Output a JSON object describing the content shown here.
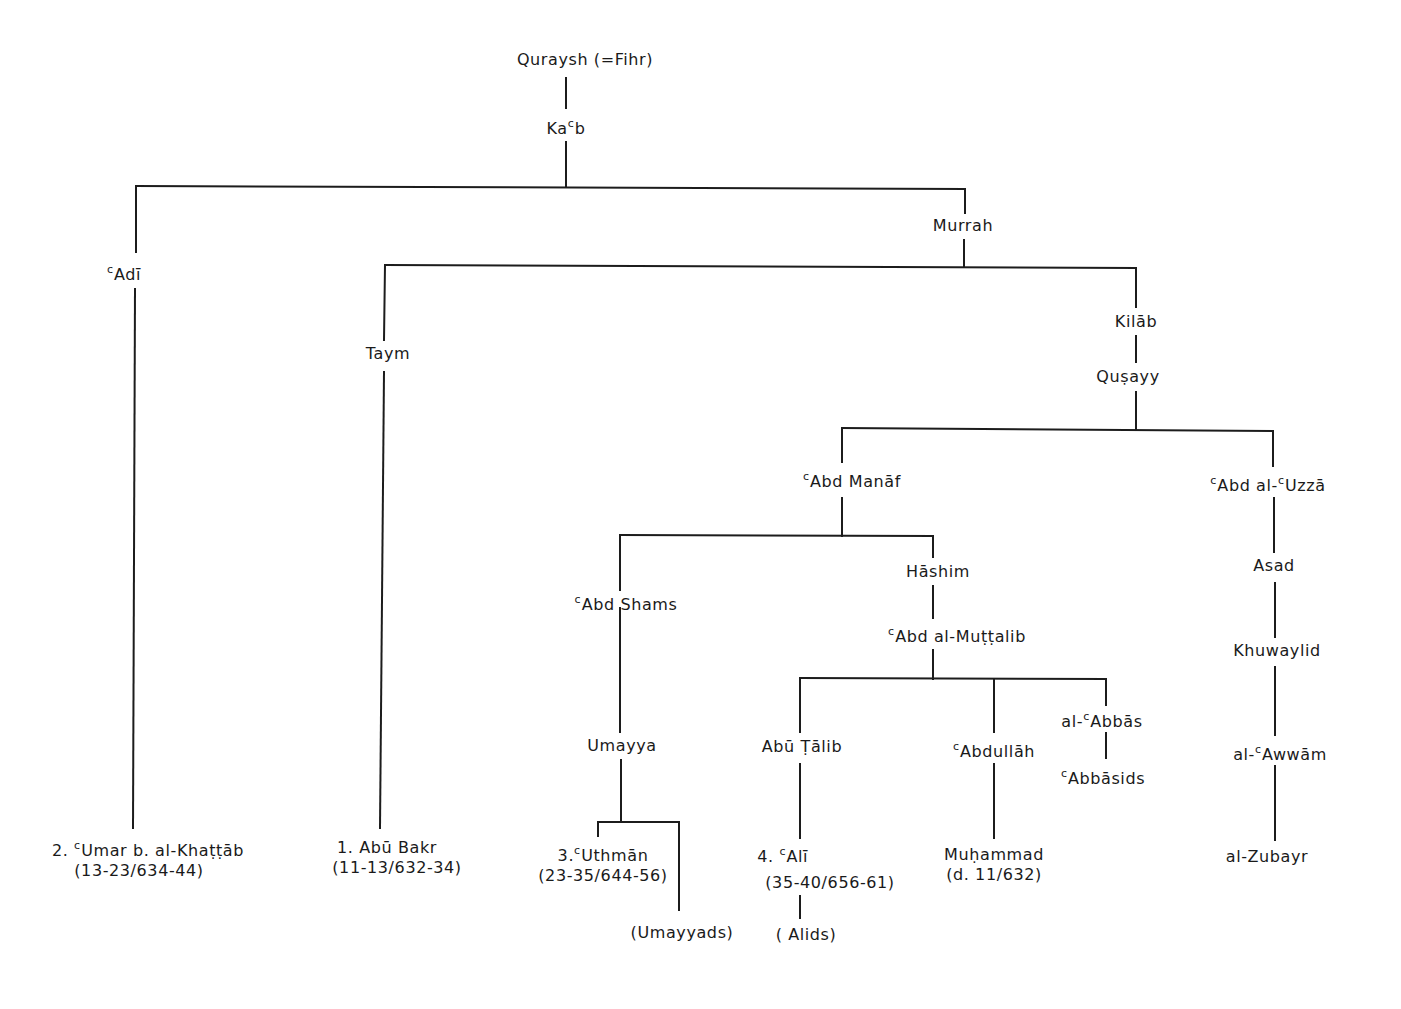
{
  "diagram": {
    "type": "genealogical-tree",
    "nodes": {
      "quraysh": {
        "label": "Quraysh (=Fihr)"
      },
      "kab": {
        "label": "Ka",
        "ayn": "c",
        "label_after": "b"
      },
      "adi": {
        "ayn": "c",
        "label": "Adī"
      },
      "murrah": {
        "label": "Murrah"
      },
      "taym": {
        "label": "Taym"
      },
      "kilab": {
        "label": "Kilāb"
      },
      "qusayy": {
        "label": "Quṣayy"
      },
      "abd_manaf": {
        "ayn": "c",
        "label": "Abd Manāf"
      },
      "abd_al_uzza": {
        "ayn": "c",
        "label": "Abd al-",
        "ayn2": "c",
        "label_after": "Uzzā"
      },
      "abd_shams": {
        "ayn": "c",
        "label": "Abd Shams"
      },
      "hashim": {
        "label": "Hāshim"
      },
      "abd_al_muttalib": {
        "ayn": "c",
        "label": "Abd al-Muṭṭalib"
      },
      "asad": {
        "label": "Asad"
      },
      "khuwaylid": {
        "label": "Khuwaylid"
      },
      "al_awwam": {
        "label": "al-",
        "ayn": "c",
        "label_after": "Awwām"
      },
      "al_zubayr": {
        "label": "al-Zubayr"
      },
      "umayya": {
        "label": "Umayya"
      },
      "abu_talib": {
        "label": "Abū Ṭālib"
      },
      "abdullah": {
        "ayn": "c",
        "label": "Abdullāh"
      },
      "al_abbas": {
        "label": "al-",
        "ayn": "c",
        "label_after": "Abbās"
      },
      "abbasids": {
        "ayn": "c",
        "label": "Abbāsids"
      },
      "umar": {
        "prefix": "2.",
        "ayn": "c",
        "label": "Umar b. al-Khaṭṭāb",
        "dates": "(13-23/634-44)"
      },
      "abu_bakr": {
        "prefix": "1.",
        "label": "Abū Bakr",
        "dates": "(11-13/632-34)"
      },
      "uthman": {
        "prefix": "3.",
        "ayn": "c",
        "label": "Uthmān",
        "dates": "(23-35/644-56)"
      },
      "ali": {
        "prefix": "4.",
        "ayn": "c",
        "label": "Alī",
        "dates": "(35-40/656-61)"
      },
      "muhammad": {
        "label": "Muḥammad",
        "dates": "(d. 11/632)"
      },
      "umayyads": {
        "label": "(Umayyads)"
      },
      "alids": {
        "label": "( Alids)"
      }
    },
    "edges": [
      [
        "quraysh",
        "kab"
      ],
      [
        "kab",
        "adi"
      ],
      [
        "kab",
        "murrah"
      ],
      [
        "adi",
        "umar"
      ],
      [
        "murrah",
        "taym"
      ],
      [
        "murrah",
        "kilab"
      ],
      [
        "taym",
        "abu_bakr"
      ],
      [
        "kilab",
        "qusayy"
      ],
      [
        "qusayy",
        "abd_manaf"
      ],
      [
        "qusayy",
        "abd_al_uzza"
      ],
      [
        "abd_manaf",
        "abd_shams"
      ],
      [
        "abd_manaf",
        "hashim"
      ],
      [
        "abd_shams",
        "umayya"
      ],
      [
        "umayya",
        "uthman"
      ],
      [
        "umayya",
        "umayyads"
      ],
      [
        "hashim",
        "abd_al_muttalib"
      ],
      [
        "abd_al_muttalib",
        "abu_talib"
      ],
      [
        "abd_al_muttalib",
        "abdullah"
      ],
      [
        "abd_al_muttalib",
        "al_abbas"
      ],
      [
        "abu_talib",
        "ali"
      ],
      [
        "ali",
        "alids"
      ],
      [
        "abdullah",
        "muhammad"
      ],
      [
        "al_abbas",
        "abbasids"
      ],
      [
        "abd_al_uzza",
        "asad"
      ],
      [
        "asad",
        "khuwaylid"
      ],
      [
        "khuwaylid",
        "al_awwam"
      ],
      [
        "al_awwam",
        "al_zubayr"
      ]
    ]
  }
}
